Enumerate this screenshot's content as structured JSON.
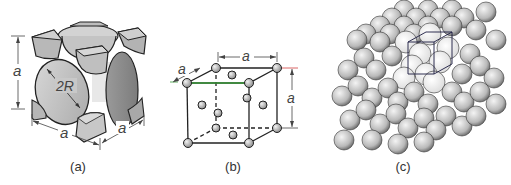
{
  "figure": {
    "panels": [
      {
        "id": "a",
        "caption": "(a)",
        "description": "hard-sphere unit cell representation",
        "labels": {
          "edge_vertical": "a",
          "edge_front": "a",
          "edge_side": "a",
          "diagonal": "2R"
        }
      },
      {
        "id": "b",
        "caption": "(b)",
        "description": "reduced-sphere unit cell",
        "labels": {
          "edge_top": "a",
          "edge_right": "a",
          "edge_depth": "a"
        }
      },
      {
        "id": "c",
        "caption": "(c)",
        "description": "aggregate of many atoms with unit cell outlined"
      }
    ],
    "colors": {
      "sphere_fill": "#c8c8c8",
      "sphere_dark": "#8e8e8e",
      "outline": "#222222",
      "dimension_line": "#444444",
      "accent_red": "#d04040",
      "accent_green": "#3a9a3a",
      "cube_outline_c": "#1a1a40"
    }
  }
}
